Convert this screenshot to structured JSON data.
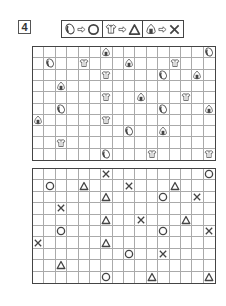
{
  "puzzle_number": "4",
  "legend": [
    {
      "from_icon": "egg",
      "to_symbol": "circle"
    },
    {
      "from_icon": "shirt",
      "to_symbol": "triangle"
    },
    {
      "from_icon": "onigiri",
      "to_symbol": "cross"
    }
  ],
  "grid": {
    "cols": 16,
    "rows": 10
  },
  "top_grid_items": [
    {
      "row": 0,
      "col": 6,
      "icon": "onigiri"
    },
    {
      "row": 0,
      "col": 15,
      "icon": "egg"
    },
    {
      "row": 1,
      "col": 1,
      "icon": "egg"
    },
    {
      "row": 1,
      "col": 4,
      "icon": "shirt"
    },
    {
      "row": 1,
      "col": 8,
      "icon": "onigiri"
    },
    {
      "row": 1,
      "col": 12,
      "icon": "shirt"
    },
    {
      "row": 2,
      "col": 6,
      "icon": "shirt"
    },
    {
      "row": 2,
      "col": 11,
      "icon": "egg"
    },
    {
      "row": 2,
      "col": 14,
      "icon": "onigiri"
    },
    {
      "row": 3,
      "col": 2,
      "icon": "onigiri"
    },
    {
      "row": 4,
      "col": 6,
      "icon": "shirt"
    },
    {
      "row": 4,
      "col": 9,
      "icon": "onigiri"
    },
    {
      "row": 4,
      "col": 13,
      "icon": "shirt"
    },
    {
      "row": 5,
      "col": 2,
      "icon": "egg"
    },
    {
      "row": 5,
      "col": 11,
      "icon": "egg"
    },
    {
      "row": 5,
      "col": 15,
      "icon": "onigiri"
    },
    {
      "row": 6,
      "col": 0,
      "icon": "onigiri"
    },
    {
      "row": 6,
      "col": 6,
      "icon": "shirt"
    },
    {
      "row": 7,
      "col": 8,
      "icon": "egg"
    },
    {
      "row": 7,
      "col": 11,
      "icon": "onigiri"
    },
    {
      "row": 8,
      "col": 2,
      "icon": "shirt"
    },
    {
      "row": 9,
      "col": 6,
      "icon": "egg"
    },
    {
      "row": 9,
      "col": 10,
      "icon": "shirt"
    },
    {
      "row": 9,
      "col": 15,
      "icon": "shirt"
    }
  ],
  "bottom_grid_items": [
    {
      "row": 0,
      "col": 6,
      "symbol": "cross"
    },
    {
      "row": 0,
      "col": 15,
      "symbol": "circle"
    },
    {
      "row": 1,
      "col": 1,
      "symbol": "circle"
    },
    {
      "row": 1,
      "col": 4,
      "symbol": "triangle"
    },
    {
      "row": 1,
      "col": 8,
      "symbol": "cross"
    },
    {
      "row": 1,
      "col": 12,
      "symbol": "triangle"
    },
    {
      "row": 2,
      "col": 6,
      "symbol": "triangle"
    },
    {
      "row": 2,
      "col": 11,
      "symbol": "circle"
    },
    {
      "row": 2,
      "col": 14,
      "symbol": "cross"
    },
    {
      "row": 3,
      "col": 2,
      "symbol": "cross"
    },
    {
      "row": 4,
      "col": 6,
      "symbol": "triangle"
    },
    {
      "row": 4,
      "col": 9,
      "symbol": "cross"
    },
    {
      "row": 4,
      "col": 13,
      "symbol": "triangle"
    },
    {
      "row": 5,
      "col": 2,
      "symbol": "circle"
    },
    {
      "row": 5,
      "col": 11,
      "symbol": "circle"
    },
    {
      "row": 5,
      "col": 15,
      "symbol": "cross"
    },
    {
      "row": 6,
      "col": 0,
      "symbol": "cross"
    },
    {
      "row": 6,
      "col": 6,
      "symbol": "triangle"
    },
    {
      "row": 7,
      "col": 8,
      "symbol": "circle"
    },
    {
      "row": 7,
      "col": 11,
      "symbol": "cross"
    },
    {
      "row": 8,
      "col": 2,
      "symbol": "triangle"
    },
    {
      "row": 9,
      "col": 6,
      "symbol": "circle"
    },
    {
      "row": 9,
      "col": 10,
      "symbol": "triangle"
    },
    {
      "row": 9,
      "col": 15,
      "symbol": "triangle"
    }
  ],
  "colors": {
    "line": "#444444",
    "grid_line": "#aaaaaa",
    "symbol": "#444444"
  }
}
